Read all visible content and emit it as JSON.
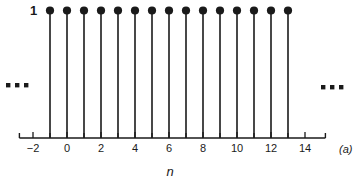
{
  "figure": {
    "panel_label": "(a)",
    "amplitude_label": "1",
    "background_color": "#ffffff",
    "ink_color": "#1a1a1a"
  },
  "ellipsis": {
    "left": "▪ ▪ ▪",
    "right": "▪ ▪ ▪"
  },
  "chart_data": {
    "type": "scatter",
    "plot_style": "stem",
    "title": "",
    "subtitle": "",
    "xlabel": "n",
    "ylabel": "",
    "annotations": [
      "1",
      "(a)"
    ],
    "legend": [],
    "legend_position": "none",
    "grid": false,
    "xlim": [
      -2.8,
      15.2
    ],
    "ylim": [
      0,
      1.12
    ],
    "x": [
      -1,
      0,
      1,
      2,
      3,
      4,
      5,
      6,
      7,
      8,
      9,
      10,
      11,
      12,
      13
    ],
    "values": [
      1,
      1,
      1,
      1,
      1,
      1,
      1,
      1,
      1,
      1,
      1,
      1,
      1,
      1,
      1
    ],
    "xticks": [
      -2,
      -1,
      0,
      1,
      2,
      3,
      4,
      5,
      6,
      7,
      8,
      9,
      10,
      11,
      12,
      13,
      14
    ],
    "xticklabels": [
      "-2",
      "",
      "0",
      "",
      "2",
      "",
      "4",
      "",
      "6",
      "",
      "8",
      "",
      "10",
      "",
      "12",
      "",
      "14"
    ],
    "yticks": [
      1
    ],
    "yticklabels": [
      "1"
    ],
    "continues_left": true,
    "continues_right": true
  }
}
